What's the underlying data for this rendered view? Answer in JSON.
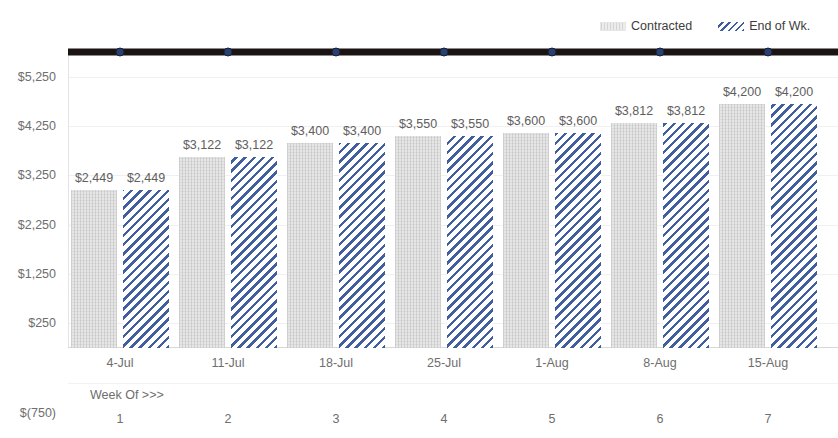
{
  "legend": {
    "entries": [
      {
        "label": "Contracted",
        "icon": "contracted-swatch-icon",
        "color": "#e2e2e2"
      },
      {
        "label": "End of Wk.",
        "icon": "end-of-week-swatch-icon",
        "color": "#3f5d9e"
      }
    ]
  },
  "axis": {
    "week_of_label": "Week Of >>>",
    "y_ticks": [
      "$5,250",
      "$4,250",
      "$3,250",
      "$2,250",
      "$1,250",
      "$250",
      "$(750)"
    ],
    "y_tick_values": [
      5250,
      4250,
      3250,
      2250,
      1250,
      250,
      -750
    ]
  },
  "chart_data": {
    "type": "bar",
    "title": "",
    "xlabel": "Week Of >>>",
    "ylabel": "",
    "ylim": [
      -750,
      5250
    ],
    "grid": true,
    "legend_position": "top-right",
    "categories": [
      "4-Jul",
      "11-Jul",
      "18-Jul",
      "25-Jul",
      "1-Aug",
      "8-Aug",
      "15-Aug"
    ],
    "week_numbers": [
      "1",
      "2",
      "3",
      "4",
      "5",
      "6",
      "7"
    ],
    "series": [
      {
        "name": "Contracted",
        "type": "bar",
        "color": "#e2e2e2",
        "values": [
          2449,
          3122,
          3400,
          3550,
          3600,
          3812,
          4200
        ],
        "labels": [
          "$2,449",
          "$3,122",
          "$3,400",
          "$3,550",
          "$3,600",
          "$3,812",
          "$4,200"
        ]
      },
      {
        "name": "End of Wk.",
        "type": "bar",
        "color": "#3f5d9e",
        "pattern": "diagonal-stripes",
        "values": [
          2449,
          3122,
          3400,
          3550,
          3600,
          3812,
          4200
        ],
        "labels": [
          "$2,449",
          "$3,122",
          "$3,400",
          "$3,550",
          "$3,600",
          "$3,812",
          "$4,200"
        ]
      },
      {
        "name": "Target",
        "type": "line",
        "color": "#1a1512",
        "marker_color": "#2a3f6e",
        "values": [
          5250,
          5250,
          5250,
          5250,
          5250,
          5250,
          5250
        ]
      }
    ]
  }
}
